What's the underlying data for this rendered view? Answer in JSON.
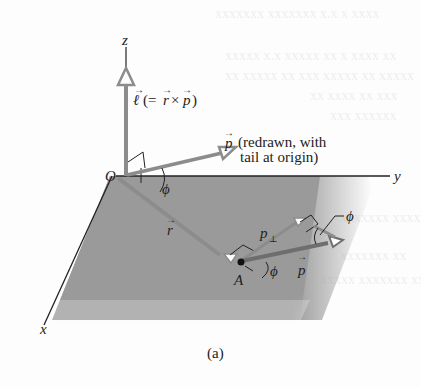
{
  "figure": {
    "caption": "(a)",
    "axes": {
      "x": "x",
      "y": "y",
      "z": "z",
      "origin": "O"
    },
    "labels": {
      "angular_momentum": "ℓ (= r × p)",
      "angular_momentum_parts": {
        "l": "ℓ",
        "eq_open": "(= ",
        "r": "r",
        "cross": "×",
        "p": "p",
        "close": ")"
      },
      "p_redrawn_line1_symbol": "p",
      "p_redrawn_line1": "(redrawn, with",
      "p_redrawn_line2": "tail at origin)",
      "r_vector": "r",
      "point_A": "A",
      "p_perp": "p",
      "p_perp_subscript": "⊥",
      "p_vector": "p",
      "phi_origin": "ϕ",
      "phi_A": "ϕ",
      "phi_tip": "ϕ"
    },
    "colors": {
      "plane": "#9a9a9a",
      "vector": "#8c8c8c",
      "axis": "#222222",
      "text": "#222222"
    }
  }
}
